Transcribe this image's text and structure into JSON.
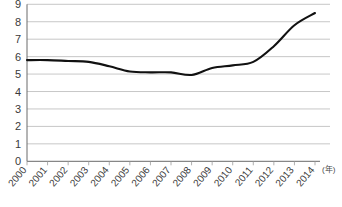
{
  "chart_data": {
    "type": "line",
    "title": "",
    "subtitle": "",
    "xlabel": "(年)",
    "ylabel": "",
    "categories": [
      "2000",
      "2001",
      "2002",
      "2003",
      "2004",
      "2005",
      "2006",
      "2007",
      "2008",
      "2009",
      "2010",
      "2011",
      "2012",
      "2013",
      "2014"
    ],
    "values": [
      5.8,
      5.8,
      5.75,
      5.7,
      5.45,
      5.15,
      5.1,
      5.1,
      4.95,
      5.35,
      5.5,
      5.7,
      6.6,
      7.8,
      8.5
    ],
    "series": [
      {
        "name": "",
        "values": [
          5.8,
          5.8,
          5.75,
          5.7,
          5.45,
          5.15,
          5.1,
          5.1,
          4.95,
          5.35,
          5.5,
          5.7,
          6.6,
          7.8,
          8.5
        ]
      }
    ],
    "ylim": [
      0,
      9
    ],
    "yticks": [
      0,
      1,
      2,
      3,
      4,
      5,
      6,
      7,
      8,
      9
    ],
    "ytick_labels": [
      "0",
      "1",
      "2",
      "3",
      "4",
      "5",
      "6",
      "7",
      "8",
      "9"
    ],
    "xlim": [
      2000,
      2014
    ],
    "grid": true,
    "grid_axis": "y",
    "legend": false,
    "legend_position": "none",
    "annotations": [],
    "colors": {
      "line": "#111111",
      "grid": "#b9b9b9",
      "axis": "#6a6a6a",
      "text": "#3a3a3a",
      "background": "#ffffff"
    }
  },
  "axis": {
    "x_unit_label": "(年)"
  }
}
